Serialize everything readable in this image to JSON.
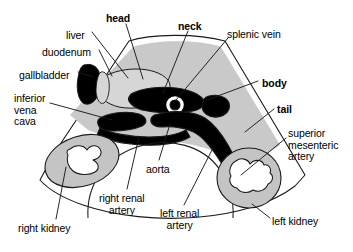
{
  "figure": {
    "type": "anatomical-ultrasound-schematic",
    "colors": {
      "background": "#ffffff",
      "tissue_gray": "#c9c9c9",
      "liver_gray": "#d6d6d6",
      "kidney_gray": "#c4c4c4",
      "vessel_black": "#000000",
      "outline": "#1a1a1a"
    },
    "scan_shape": "sector-fan",
    "labels": [
      {
        "id": "head",
        "text": "head",
        "bold": true,
        "x": 106,
        "y": 13,
        "align": "left"
      },
      {
        "id": "liver",
        "text": "liver",
        "bold": false,
        "x": 66,
        "y": 30,
        "align": "left"
      },
      {
        "id": "duodenum",
        "text": "duodenum",
        "bold": false,
        "x": 42,
        "y": 47,
        "align": "left"
      },
      {
        "id": "gallbladder",
        "text": "gallbladder",
        "bold": false,
        "x": 19,
        "y": 70,
        "align": "left"
      },
      {
        "id": "ivc",
        "text": "inferior\nvena\ncava",
        "bold": false,
        "x": 14,
        "y": 93,
        "align": "left"
      },
      {
        "id": "neck",
        "text": "neck",
        "bold": true,
        "x": 178,
        "y": 21,
        "align": "left"
      },
      {
        "id": "splenic-vein",
        "text": "splenic vein",
        "bold": false,
        "x": 227,
        "y": 29,
        "align": "left"
      },
      {
        "id": "body",
        "text": "body",
        "bold": true,
        "x": 262,
        "y": 78,
        "align": "left"
      },
      {
        "id": "tail",
        "text": "tail",
        "bold": true,
        "x": 277,
        "y": 104,
        "align": "left"
      },
      {
        "id": "sma",
        "text": "superior\nmesenteric\nartery",
        "bold": false,
        "x": 288,
        "y": 128,
        "align": "left"
      },
      {
        "id": "left-kidney",
        "text": "left kidney",
        "bold": false,
        "x": 272,
        "y": 216,
        "align": "left"
      },
      {
        "id": "aorta",
        "text": "aorta",
        "bold": false,
        "x": 146,
        "y": 164,
        "align": "left"
      },
      {
        "id": "right-renal",
        "text": "right renal\nartery",
        "bold": false,
        "x": 99,
        "y": 193,
        "align": "left"
      },
      {
        "id": "left-renal",
        "text": "left renal\nartery",
        "bold": false,
        "x": 160,
        "y": 208,
        "align": "left"
      },
      {
        "id": "right-kidney",
        "text": "right kidney",
        "bold": false,
        "x": 18,
        "y": 223,
        "align": "left"
      }
    ],
    "structures": [
      {
        "id": "scan-sector",
        "name": "ultrasound sector outline"
      },
      {
        "id": "liver-region",
        "name": "liver parenchyma"
      },
      {
        "id": "gallbladder",
        "name": "gallbladder"
      },
      {
        "id": "duodenum",
        "name": "duodenum"
      },
      {
        "id": "pancreas",
        "name": "pancreas head neck body tail"
      },
      {
        "id": "splenic-vein",
        "name": "splenic vein"
      },
      {
        "id": "ivc",
        "name": "inferior vena cava"
      },
      {
        "id": "aorta",
        "name": "aorta"
      },
      {
        "id": "sma",
        "name": "superior mesenteric artery"
      },
      {
        "id": "right-renal-artery",
        "name": "right renal artery"
      },
      {
        "id": "left-renal-artery",
        "name": "left renal artery"
      },
      {
        "id": "right-kidney",
        "name": "right kidney"
      },
      {
        "id": "left-kidney",
        "name": "left kidney"
      },
      {
        "id": "spine",
        "name": "vertebral body shadow"
      }
    ]
  }
}
